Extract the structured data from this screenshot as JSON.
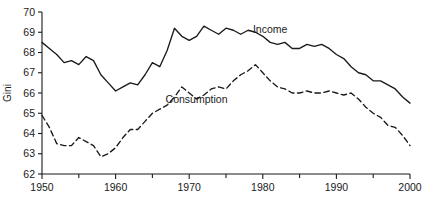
{
  "chart_data": {
    "type": "line",
    "title": "",
    "xlabel": "",
    "ylabel": "Gini",
    "xlim": [
      1950,
      2000
    ],
    "ylim": [
      62,
      70
    ],
    "grid": false,
    "legend_position": "inline-annotation",
    "y_ticks": [
      62,
      63,
      64,
      65,
      66,
      67,
      68,
      69,
      70
    ],
    "x_ticks_major": [
      1950,
      1960,
      1970,
      1980,
      1990,
      2000
    ],
    "x_ticks_minor": [
      1955,
      1965,
      1975,
      1985,
      1995
    ],
    "x_tick_labels": [
      "1950",
      "1960",
      "1970",
      "1980",
      "1990",
      "2000"
    ],
    "y_tick_labels": [
      "62",
      "63",
      "64",
      "65",
      "66",
      "67",
      "68",
      "69",
      "70"
    ],
    "annotations": [
      {
        "text": "Income",
        "x": 1981,
        "y": 68.95
      },
      {
        "text": "Consumption",
        "x": 1971,
        "y": 65.5
      }
    ],
    "series": [
      {
        "name": "Income",
        "style": "solid",
        "color": "#1a1a1a",
        "x": [
          1950,
          1951,
          1952,
          1953,
          1954,
          1955,
          1956,
          1957,
          1958,
          1959,
          1960,
          1961,
          1962,
          1963,
          1964,
          1965,
          1966,
          1967,
          1968,
          1969,
          1970,
          1971,
          1972,
          1973,
          1974,
          1975,
          1976,
          1977,
          1978,
          1979,
          1980,
          1981,
          1982,
          1983,
          1984,
          1985,
          1986,
          1987,
          1988,
          1989,
          1990,
          1991,
          1992,
          1993,
          1994,
          1995,
          1996,
          1997,
          1998,
          1999,
          2000
        ],
        "values": [
          68.5,
          68.2,
          67.9,
          67.5,
          67.6,
          67.4,
          67.8,
          67.6,
          66.9,
          66.5,
          66.1,
          66.3,
          66.5,
          66.4,
          66.9,
          67.5,
          67.3,
          68.1,
          69.2,
          68.8,
          68.6,
          68.8,
          69.3,
          69.1,
          68.9,
          69.2,
          69.1,
          68.9,
          69.1,
          69.0,
          68.8,
          68.5,
          68.4,
          68.5,
          68.2,
          68.2,
          68.4,
          68.3,
          68.4,
          68.2,
          67.9,
          67.7,
          67.3,
          67.0,
          66.9,
          66.6,
          66.6,
          66.4,
          66.2,
          65.8,
          65.5
        ]
      },
      {
        "name": "Consumption",
        "style": "dashed",
        "color": "#1a1a1a",
        "x": [
          1950,
          1951,
          1952,
          1953,
          1954,
          1955,
          1956,
          1957,
          1958,
          1959,
          1960,
          1961,
          1962,
          1963,
          1964,
          1965,
          1966,
          1967,
          1968,
          1969,
          1970,
          1971,
          1972,
          1973,
          1974,
          1975,
          1976,
          1977,
          1978,
          1979,
          1980,
          1981,
          1982,
          1983,
          1984,
          1985,
          1986,
          1987,
          1988,
          1989,
          1990,
          1991,
          1992,
          1993,
          1994,
          1995,
          1996,
          1997,
          1998,
          1999,
          2000
        ],
        "values": [
          64.9,
          64.3,
          63.5,
          63.4,
          63.4,
          63.8,
          63.6,
          63.4,
          62.85,
          63.0,
          63.3,
          63.8,
          64.2,
          64.2,
          64.6,
          65.0,
          65.2,
          65.4,
          65.8,
          66.3,
          66.0,
          65.7,
          65.9,
          66.2,
          66.3,
          66.2,
          66.6,
          66.9,
          67.1,
          67.4,
          67.0,
          66.6,
          66.3,
          66.2,
          66.0,
          66.0,
          66.1,
          66.0,
          66.0,
          66.1,
          66.0,
          65.9,
          66.0,
          65.7,
          65.3,
          65.0,
          64.8,
          64.4,
          64.3,
          63.9,
          63.4
        ]
      }
    ]
  }
}
